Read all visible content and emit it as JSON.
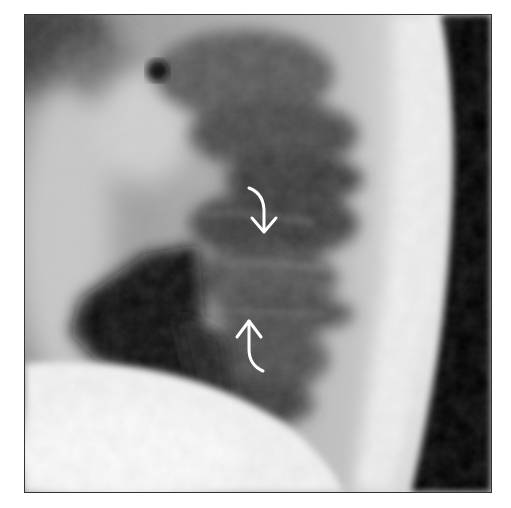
{
  "figure": {
    "type": "radiograph",
    "view": "lateral thoracolumbar spine",
    "annotations": [
      {
        "name": "curved-arrow-down",
        "direction": "down",
        "color": "#ffffff"
      },
      {
        "name": "curved-arrow-up",
        "direction": "up",
        "color": "#ffffff"
      }
    ],
    "colors": {
      "background": "#ffffff",
      "border": "#333333",
      "dark_region": "#050505",
      "bright_region": "#f4f4f4"
    }
  }
}
